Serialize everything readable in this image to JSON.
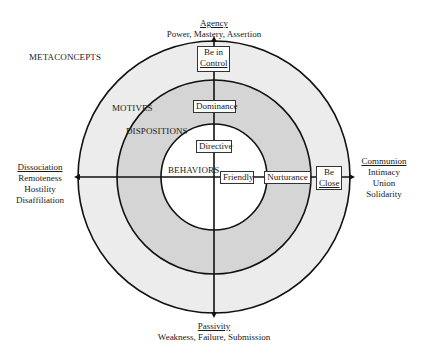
{
  "diagram": {
    "colors": {
      "outer_ring": "#ececec",
      "middle_ring": "#d5d5d5",
      "inner_circle": "#ffffff",
      "stroke": "#111111"
    },
    "levels": {
      "metaconcepts": "METACONCEPTS",
      "motives": "MOTIVES",
      "dispositions": "DISPOSITIONS",
      "behaviors": "BEHAVIORS"
    },
    "poles": {
      "top": {
        "title": "Agency",
        "subtitle": "Power, Mastery, Assertion"
      },
      "bottom": {
        "title": "Passivity",
        "subtitle": "Weakness, Failure, Submission"
      },
      "left": {
        "title": "Dissociation",
        "lines": [
          "Remoteness",
          "Hostility",
          "Disaffiliation"
        ]
      },
      "right": {
        "title": "Communion",
        "lines": [
          "Intimacy",
          "Union",
          "Solidarity"
        ]
      }
    },
    "vertical_boxes": {
      "motive": {
        "line1": "Be in",
        "line2": "Control"
      },
      "disposition": "Dominance",
      "behavior": "Directive"
    },
    "horizontal_boxes": {
      "behavior": "Friendly",
      "disposition": "Nurturance",
      "motive": {
        "line1": "Be",
        "line2": "Close"
      }
    }
  }
}
